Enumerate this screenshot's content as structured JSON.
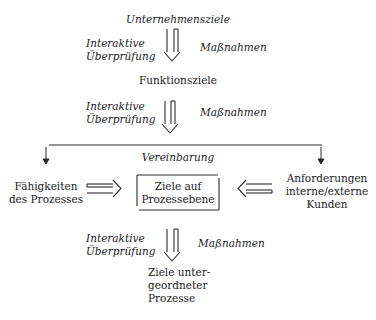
{
  "diagram": {
    "top_goal": "Unternehmensziele",
    "level1": {
      "left_label_line1": "Interaktive",
      "left_label_line2": "Überprüfung",
      "right_label": "Maßnahmen"
    },
    "functional_goal": "Funktionsziele",
    "level2": {
      "left_label_line1": "Interaktive",
      "left_label_line2": "Überprüfung",
      "right_label": "Maßnahmen"
    },
    "agreement_label": "Vereinbarung",
    "left_input": {
      "line1": "Fähigkeiten",
      "line2": "des Prozesses"
    },
    "center_box": {
      "line1": "Ziele auf",
      "line2": "Prozessebene"
    },
    "right_input": {
      "line1": "Anforderungen",
      "line2": "interne/externe",
      "line3": "Kunden"
    },
    "level3": {
      "left_label_line1": "Interaktive",
      "left_label_line2": "Überprüfung",
      "right_label": "Maßnahmen"
    },
    "bottom_goal": {
      "line1": "Ziele unter-",
      "line2": "geordneter",
      "line3": "Prozesse"
    },
    "colors": {
      "line": "#2a2a2a",
      "background": "#ffffff"
    }
  }
}
